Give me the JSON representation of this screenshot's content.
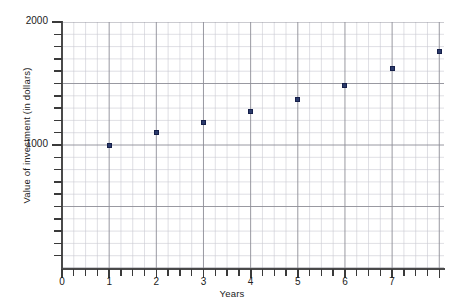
{
  "chart_data": {
    "type": "scatter",
    "title": "",
    "xlabel": "Years",
    "ylabel": "Value of investment (in dollars)",
    "xlim": [
      0,
      8.1
    ],
    "ylim": [
      0,
      2000
    ],
    "grid": true,
    "legend": "none",
    "marker_color": "#2b3a6b",
    "x_tick_labels": [
      "0",
      "1",
      "2",
      "3",
      "4",
      "5",
      "6",
      "7"
    ],
    "x_ticks": [
      0,
      1,
      2,
      3,
      4,
      5,
      6,
      7
    ],
    "x_minor_step": 0.25,
    "y_tick_labels": [
      "1000",
      "2000"
    ],
    "y_ticks": [
      1000,
      2000
    ],
    "y_minor_step": 100,
    "x": [
      1,
      2,
      3,
      4,
      5,
      6,
      7,
      8
    ],
    "values": [
      1000,
      1100,
      1180,
      1270,
      1370,
      1480,
      1620,
      1760
    ],
    "points": [
      {
        "x": 1,
        "y": 1000
      },
      {
        "x": 2,
        "y": 1100
      },
      {
        "x": 3,
        "y": 1180
      },
      {
        "x": 4,
        "y": 1270
      },
      {
        "x": 5,
        "y": 1370
      },
      {
        "x": 6,
        "y": 1480
      },
      {
        "x": 7,
        "y": 1620
      },
      {
        "x": 8,
        "y": 1760
      }
    ]
  }
}
